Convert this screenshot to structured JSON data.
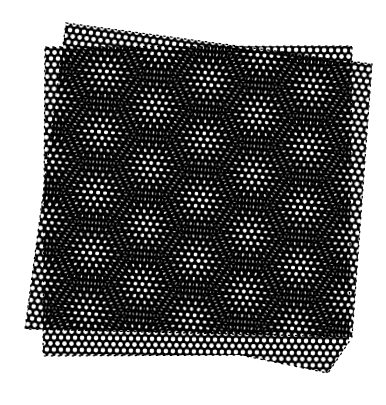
{
  "image": {
    "description": "Moire pattern formed by two overlapping perforated sheets with hexagonal hole lattices, slightly rotated relative to each other",
    "background_color": "#ffffff",
    "sheet_color": "#000000",
    "hole_color": "#ffffff",
    "hole_pitch_px": 7,
    "hole_radius_px": 2.3
  },
  "sheets": [
    {
      "name": "back-sheet",
      "rotation_deg": 7.5,
      "polygon": "66,23 372,64 352,337 25,329"
    },
    {
      "name": "front-sheet",
      "rotation_deg": 0,
      "polygon": "45,47 352,46 349,342 328,373 240,355 43,356"
    }
  ]
}
